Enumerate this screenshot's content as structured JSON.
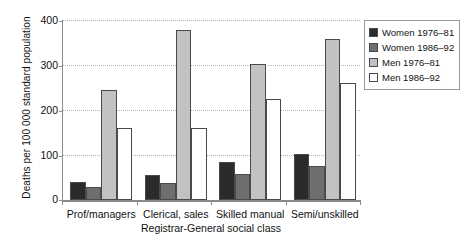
{
  "chart_data": {
    "type": "bar",
    "title": "",
    "xlabel": "Registrar-General social class",
    "ylabel": "Deaths per 100 000 standard population",
    "categories": [
      "Prof/managers",
      "Clerical, sales",
      "Skilled manual",
      "Semi/unskilled"
    ],
    "ylim": [
      0,
      400
    ],
    "yticks": [
      0,
      100,
      200,
      300,
      400
    ],
    "grid": "horizontal-dotted",
    "legend_position": "upper-right-outside",
    "series": [
      {
        "name": "Women 1976–81",
        "color": "#2b2b2b",
        "values": [
          40,
          55,
          85,
          102
        ]
      },
      {
        "name": "Women 1986–92",
        "color": "#6e6e6e",
        "values": [
          29,
          37,
          58,
          75
        ]
      },
      {
        "name": "Men 1976–81",
        "color": "#c2c2c2",
        "values": [
          244,
          378,
          303,
          357
        ]
      },
      {
        "name": "Men 1986–92",
        "color": "#ffffff",
        "values": [
          159,
          159,
          225,
          260
        ]
      }
    ]
  }
}
